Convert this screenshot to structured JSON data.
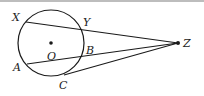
{
  "figure": {
    "circle": {
      "center_label": "O",
      "cx": 51,
      "cy": 43,
      "r": 33
    },
    "points": {
      "X": {
        "label": "X",
        "x": 26,
        "y": 22
      },
      "Y": {
        "label": "Y",
        "x": 83,
        "y": 30
      },
      "Z": {
        "label": "Z",
        "x": 178,
        "y": 43
      },
      "A": {
        "label": "A",
        "x": 27,
        "y": 64
      },
      "B": {
        "label": "B",
        "x": 82,
        "y": 57
      },
      "C": {
        "label": "C",
        "x": 64,
        "y": 75
      },
      "O": {
        "label": "O",
        "x": 51,
        "y": 43
      }
    },
    "segments": [
      "XZ",
      "AZ",
      "CZ"
    ],
    "stroke_color": "#1a1a1a"
  }
}
